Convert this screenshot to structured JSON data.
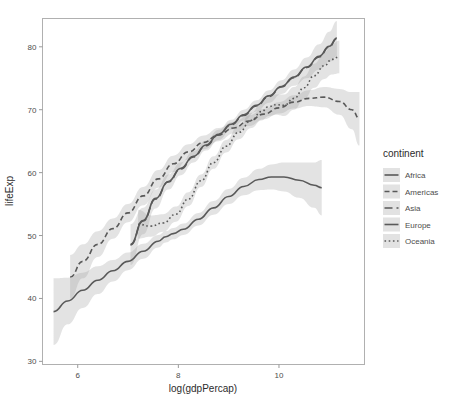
{
  "chart_data": {
    "type": "line",
    "title": "",
    "subtitle": "",
    "xlabel": "log(gdpPercap)",
    "ylabel": "lifeExp",
    "xlim": [
      5.3,
      11.7
    ],
    "ylim": [
      29.5,
      84.5
    ],
    "xticks": [
      6,
      8,
      10
    ],
    "yticks": [
      30,
      40,
      50,
      60,
      70,
      80
    ],
    "xtick_labels": [
      "6",
      "8",
      "10"
    ],
    "ytick_labels": [
      "30",
      "40",
      "50",
      "60",
      "70",
      "80"
    ],
    "grid": false,
    "legend_position": "right",
    "legend_title": "continent",
    "series": [
      {
        "name": "Africa",
        "linetype": "solid",
        "dasharray": "",
        "points": [
          [
            5.52,
            37.9
          ],
          [
            5.8,
            39.6
          ],
          [
            6.1,
            41.3
          ],
          [
            6.4,
            42.9
          ],
          [
            6.7,
            44.4
          ],
          [
            7.0,
            45.9
          ],
          [
            7.3,
            47.5
          ],
          [
            7.6,
            49.1
          ],
          [
            7.75,
            49.8
          ],
          [
            7.9,
            50.3
          ],
          [
            8.1,
            51.0
          ],
          [
            8.4,
            52.6
          ],
          [
            8.7,
            54.4
          ],
          [
            9.0,
            56.2
          ],
          [
            9.3,
            57.8
          ],
          [
            9.6,
            58.9
          ],
          [
            9.85,
            59.3
          ],
          [
            10.1,
            59.3
          ],
          [
            10.4,
            58.8
          ],
          [
            10.7,
            58.0
          ],
          [
            10.85,
            57.6
          ]
        ],
        "ribbon_lo": [
          [
            5.52,
            32.6
          ],
          [
            5.8,
            35.9
          ],
          [
            6.1,
            38.5
          ],
          [
            6.4,
            40.7
          ],
          [
            6.7,
            42.7
          ],
          [
            7.0,
            44.5
          ],
          [
            7.3,
            46.3
          ],
          [
            7.6,
            48.1
          ],
          [
            7.75,
            48.9
          ],
          [
            7.9,
            49.4
          ],
          [
            8.1,
            50.1
          ],
          [
            8.4,
            51.6
          ],
          [
            8.7,
            53.3
          ],
          [
            9.0,
            55.0
          ],
          [
            9.3,
            56.4
          ],
          [
            9.6,
            57.2
          ],
          [
            9.85,
            57.3
          ],
          [
            10.1,
            57.0
          ],
          [
            10.4,
            56.0
          ],
          [
            10.7,
            54.4
          ],
          [
            10.85,
            53.2
          ]
        ],
        "ribbon_hi": [
          [
            5.52,
            43.2
          ],
          [
            5.8,
            43.3
          ],
          [
            6.1,
            44.1
          ],
          [
            6.4,
            45.1
          ],
          [
            6.7,
            46.1
          ],
          [
            7.0,
            47.3
          ],
          [
            7.3,
            48.7
          ],
          [
            7.6,
            50.1
          ],
          [
            7.75,
            50.7
          ],
          [
            7.9,
            51.2
          ],
          [
            8.1,
            51.9
          ],
          [
            8.4,
            53.6
          ],
          [
            8.7,
            55.5
          ],
          [
            9.0,
            57.4
          ],
          [
            9.3,
            59.2
          ],
          [
            9.6,
            60.6
          ],
          [
            9.85,
            61.3
          ],
          [
            10.1,
            61.6
          ],
          [
            10.4,
            61.6
          ],
          [
            10.7,
            61.6
          ],
          [
            10.85,
            62.0
          ]
        ]
      },
      {
        "name": "Americas",
        "linetype": "dashed",
        "dasharray": "5,3",
        "points": [
          [
            5.85,
            43.4
          ],
          [
            6.1,
            45.9
          ],
          [
            6.4,
            48.6
          ],
          [
            6.7,
            51.1
          ],
          [
            7.0,
            53.6
          ],
          [
            7.3,
            56.3
          ],
          [
            7.6,
            59.0
          ],
          [
            7.9,
            61.4
          ],
          [
            8.2,
            63.3
          ],
          [
            8.5,
            64.8
          ],
          [
            8.8,
            66.0
          ],
          [
            9.1,
            67.1
          ],
          [
            9.4,
            68.2
          ],
          [
            9.7,
            69.3
          ],
          [
            10.0,
            70.3
          ],
          [
            10.3,
            71.2
          ],
          [
            10.6,
            71.8
          ],
          [
            10.9,
            72.0
          ],
          [
            11.2,
            71.3
          ],
          [
            11.45,
            70.0
          ],
          [
            11.6,
            68.6
          ]
        ],
        "ribbon_lo": [
          [
            5.85,
            40.0
          ],
          [
            6.1,
            43.2
          ],
          [
            6.4,
            46.6
          ],
          [
            6.7,
            49.5
          ],
          [
            7.0,
            52.1
          ],
          [
            7.3,
            54.8
          ],
          [
            7.6,
            57.6
          ],
          [
            7.9,
            60.1
          ],
          [
            8.2,
            62.1
          ],
          [
            8.5,
            63.7
          ],
          [
            8.8,
            65.0
          ],
          [
            9.1,
            66.2
          ],
          [
            9.4,
            67.4
          ],
          [
            9.7,
            68.5
          ],
          [
            10.0,
            69.4
          ],
          [
            10.3,
            70.2
          ],
          [
            10.6,
            70.6
          ],
          [
            10.9,
            70.4
          ],
          [
            11.2,
            69.2
          ],
          [
            11.45,
            66.9
          ],
          [
            11.6,
            64.3
          ]
        ],
        "ribbon_hi": [
          [
            5.85,
            46.9
          ],
          [
            6.1,
            48.6
          ],
          [
            6.4,
            50.7
          ],
          [
            6.7,
            52.7
          ],
          [
            7.0,
            55.0
          ],
          [
            7.3,
            57.7
          ],
          [
            7.6,
            60.4
          ],
          [
            7.9,
            62.7
          ],
          [
            8.2,
            64.5
          ],
          [
            8.5,
            65.9
          ],
          [
            8.8,
            67.1
          ],
          [
            9.1,
            68.1
          ],
          [
            9.4,
            69.1
          ],
          [
            9.7,
            70.1
          ],
          [
            10.0,
            71.2
          ],
          [
            10.3,
            72.3
          ],
          [
            10.6,
            73.1
          ],
          [
            10.9,
            73.6
          ],
          [
            11.2,
            73.3
          ],
          [
            11.45,
            72.8
          ],
          [
            11.6,
            72.8
          ]
        ]
      },
      {
        "name": "Asia",
        "linetype": "longdash",
        "dasharray": "8,4",
        "points": [
          [
            7.05,
            48.5
          ],
          [
            7.3,
            52.3
          ],
          [
            7.55,
            55.8
          ],
          [
            7.8,
            58.5
          ],
          [
            8.05,
            60.6
          ],
          [
            8.3,
            62.5
          ],
          [
            8.55,
            64.3
          ],
          [
            8.8,
            66.0
          ],
          [
            9.05,
            67.6
          ],
          [
            9.3,
            69.1
          ],
          [
            9.55,
            70.6
          ],
          [
            9.8,
            72.1
          ],
          [
            10.05,
            73.6
          ],
          [
            10.3,
            75.1
          ],
          [
            10.55,
            76.7
          ],
          [
            10.8,
            78.4
          ],
          [
            11.0,
            80.0
          ],
          [
            11.15,
            81.3
          ]
        ],
        "ribbon_lo": [
          [
            7.05,
            45.3
          ],
          [
            7.3,
            50.2
          ],
          [
            7.55,
            54.3
          ],
          [
            7.8,
            57.3
          ],
          [
            8.05,
            59.6
          ],
          [
            8.3,
            61.6
          ],
          [
            8.55,
            63.5
          ],
          [
            8.8,
            65.2
          ],
          [
            9.05,
            66.8
          ],
          [
            9.3,
            68.3
          ],
          [
            9.55,
            69.7
          ],
          [
            9.8,
            71.1
          ],
          [
            10.05,
            72.5
          ],
          [
            10.3,
            73.8
          ],
          [
            10.55,
            75.0
          ],
          [
            10.8,
            76.4
          ],
          [
            11.0,
            77.6
          ],
          [
            11.15,
            78.5
          ]
        ],
        "ribbon_hi": [
          [
            7.05,
            51.8
          ],
          [
            7.3,
            54.4
          ],
          [
            7.55,
            57.3
          ],
          [
            7.8,
            59.7
          ],
          [
            8.05,
            61.6
          ],
          [
            8.3,
            63.4
          ],
          [
            8.55,
            65.1
          ],
          [
            8.8,
            66.8
          ],
          [
            9.05,
            68.4
          ],
          [
            9.3,
            70.0
          ],
          [
            9.55,
            71.5
          ],
          [
            9.8,
            73.1
          ],
          [
            10.05,
            74.7
          ],
          [
            10.3,
            76.4
          ],
          [
            10.55,
            78.3
          ],
          [
            10.8,
            80.4
          ],
          [
            11.0,
            82.4
          ],
          [
            11.15,
            84.1
          ]
        ]
      },
      {
        "name": "Europe",
        "linetype": "solid",
        "dasharray": "",
        "points": [
          [
            7.05,
            48.6
          ],
          [
            7.3,
            52.4
          ],
          [
            7.55,
            55.9
          ],
          [
            7.8,
            58.6
          ],
          [
            8.05,
            60.7
          ],
          [
            8.3,
            62.6
          ],
          [
            8.55,
            64.4
          ],
          [
            8.8,
            66.1
          ],
          [
            9.05,
            67.7
          ],
          [
            9.3,
            69.2
          ],
          [
            9.55,
            70.7
          ],
          [
            9.8,
            72.2
          ],
          [
            10.05,
            73.7
          ],
          [
            10.3,
            75.2
          ],
          [
            10.55,
            76.8
          ],
          [
            10.8,
            78.5
          ],
          [
            11.0,
            80.1
          ],
          [
            11.15,
            81.4
          ]
        ],
        "ribbon_lo": [],
        "ribbon_hi": []
      },
      {
        "name": "Oceania",
        "linetype": "dotted",
        "dasharray": "1.6,2.6",
        "points": [
          [
            7.2,
            51.8
          ],
          [
            7.45,
            51.5
          ],
          [
            7.7,
            52.0
          ],
          [
            7.95,
            53.4
          ],
          [
            8.2,
            55.8
          ],
          [
            8.45,
            58.7
          ],
          [
            8.7,
            61.6
          ],
          [
            8.95,
            64.2
          ],
          [
            9.2,
            66.4
          ],
          [
            9.45,
            68.3
          ],
          [
            9.65,
            69.7
          ],
          [
            9.8,
            70.5
          ],
          [
            9.95,
            70.8
          ],
          [
            10.1,
            70.7
          ],
          [
            10.3,
            71.8
          ],
          [
            10.5,
            73.5
          ],
          [
            10.7,
            75.4
          ],
          [
            10.9,
            77.0
          ],
          [
            11.05,
            78.0
          ],
          [
            11.2,
            78.4
          ]
        ],
        "ribbon_lo": [
          [
            7.2,
            49.5
          ],
          [
            7.45,
            49.8
          ],
          [
            7.7,
            50.6
          ],
          [
            7.95,
            52.2
          ],
          [
            8.2,
            54.7
          ],
          [
            8.45,
            57.7
          ],
          [
            8.7,
            60.6
          ],
          [
            8.95,
            63.2
          ],
          [
            9.2,
            65.3
          ],
          [
            9.45,
            67.1
          ],
          [
            9.65,
            68.3
          ],
          [
            9.8,
            69.0
          ],
          [
            9.95,
            69.2
          ],
          [
            10.1,
            69.0
          ],
          [
            10.3,
            70.0
          ],
          [
            10.5,
            71.7
          ],
          [
            10.7,
            73.5
          ],
          [
            10.9,
            74.9
          ],
          [
            11.05,
            75.6
          ],
          [
            11.2,
            75.8
          ]
        ],
        "ribbon_hi": [
          [
            7.2,
            54.1
          ],
          [
            7.45,
            53.2
          ],
          [
            7.7,
            53.4
          ],
          [
            7.95,
            54.6
          ],
          [
            8.2,
            56.9
          ],
          [
            8.45,
            59.7
          ],
          [
            8.7,
            62.6
          ],
          [
            8.95,
            65.2
          ],
          [
            9.2,
            67.5
          ],
          [
            9.45,
            69.5
          ],
          [
            9.65,
            71.1
          ],
          [
            9.8,
            72.0
          ],
          [
            9.95,
            72.4
          ],
          [
            10.1,
            72.4
          ],
          [
            10.3,
            73.6
          ],
          [
            10.5,
            75.3
          ],
          [
            10.7,
            77.3
          ],
          [
            10.9,
            79.1
          ],
          [
            11.05,
            80.4
          ],
          [
            11.2,
            81.0
          ]
        ]
      }
    ]
  },
  "legend": {
    "title": "continent",
    "items": [
      {
        "label": "Africa",
        "dasharray": ""
      },
      {
        "label": "Americas",
        "dasharray": "5,3"
      },
      {
        "label": "Asia",
        "dasharray": "8,4"
      },
      {
        "label": "Europe",
        "dasharray": ""
      },
      {
        "label": "Oceania",
        "dasharray": "1.6,2.6"
      }
    ]
  },
  "colors": {
    "line": "#595959",
    "ribbon": "#9c9c9c",
    "panel_border": "#b0b0b0",
    "axis_text": "#4d4d4d",
    "axis_title": "#2b2b2b",
    "background": "#ffffff",
    "legend_key_bg": "#e2e2e2"
  }
}
